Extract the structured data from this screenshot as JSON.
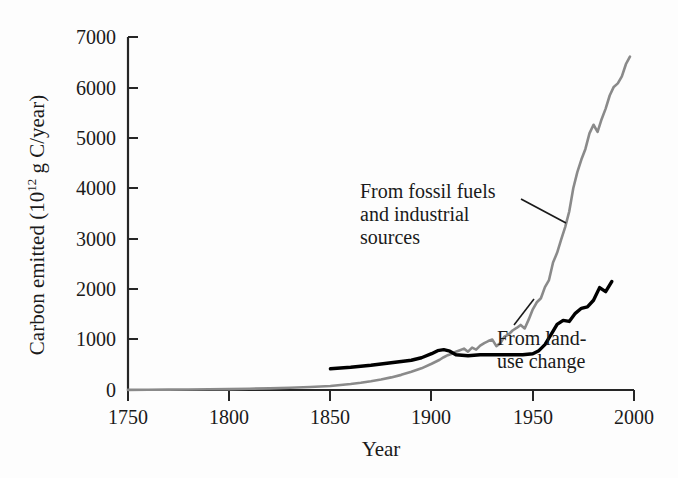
{
  "figure": {
    "background_color": "#fdfdfd",
    "axis_color": "#262626"
  },
  "chart_data": {
    "type": "line",
    "title": "",
    "xlabel": "Year",
    "ylabel": "Carbon emitted (10^12 g C/year)",
    "ylabel_prefix": "Carbon emitted (10",
    "ylabel_exponent": "12",
    "ylabel_suffix": " g C/year)",
    "xlim": [
      1750,
      2000
    ],
    "ylim": [
      0,
      7000
    ],
    "xticks": [
      1750,
      1800,
      1850,
      1900,
      1950,
      2000
    ],
    "xtick_labels": [
      "1750",
      "1800",
      "1850",
      "1900",
      "1950",
      "2000"
    ],
    "yticks": [
      0,
      1000,
      2000,
      3000,
      4000,
      5000,
      6000,
      7000
    ],
    "ytick_labels": [
      "0",
      "1000",
      "2000",
      "3000",
      "4000",
      "5000",
      "6000",
      "7000"
    ],
    "grid": false,
    "legend_position": "inline-annotations",
    "series": [
      {
        "name": "From fossil fuels and industrial sources",
        "label_lines": [
          "From fossil fuels",
          "and industrial",
          "sources"
        ],
        "color": "#8a8a8a",
        "line_width": 2.6,
        "x": [
          1750,
          1760,
          1770,
          1780,
          1790,
          1800,
          1810,
          1820,
          1830,
          1840,
          1850,
          1855,
          1860,
          1865,
          1870,
          1875,
          1880,
          1885,
          1890,
          1895,
          1900,
          1902,
          1904,
          1906,
          1908,
          1910,
          1912,
          1914,
          1916,
          1918,
          1920,
          1922,
          1924,
          1926,
          1928,
          1930,
          1932,
          1934,
          1936,
          1938,
          1940,
          1942,
          1944,
          1946,
          1948,
          1950,
          1952,
          1954,
          1956,
          1958,
          1960,
          1962,
          1964,
          1966,
          1968,
          1970,
          1972,
          1974,
          1976,
          1978,
          1980,
          1982,
          1984,
          1986,
          1988,
          1990,
          1992,
          1994,
          1996,
          1998
        ],
        "y": [
          3,
          5,
          8,
          10,
          14,
          18,
          25,
          33,
          45,
          60,
          80,
          100,
          120,
          145,
          175,
          210,
          250,
          300,
          360,
          430,
          520,
          560,
          600,
          650,
          690,
          720,
          760,
          790,
          820,
          760,
          840,
          800,
          880,
          930,
          970,
          1000,
          870,
          930,
          1060,
          1100,
          1180,
          1230,
          1290,
          1220,
          1400,
          1600,
          1740,
          1820,
          2040,
          2180,
          2530,
          2720,
          2980,
          3230,
          3540,
          4000,
          4320,
          4570,
          4780,
          5090,
          5260,
          5120,
          5370,
          5580,
          5840,
          6010,
          6080,
          6220,
          6460,
          6610
        ],
        "note": "Fossil fuel and industrial carbon emissions; jagged year-to-year variation"
      },
      {
        "name": "From land-use change",
        "label_lines": [
          "From land-",
          "use change"
        ],
        "color": "#000000",
        "line_width": 3.4,
        "x": [
          1850,
          1860,
          1870,
          1880,
          1890,
          1895,
          1900,
          1903,
          1906,
          1909,
          1912,
          1915,
          1918,
          1921,
          1924,
          1927,
          1930,
          1935,
          1940,
          1945,
          1950,
          1953,
          1956,
          1959,
          1962,
          1965,
          1968,
          1971,
          1974,
          1977,
          1980,
          1983,
          1986,
          1989
        ],
        "y": [
          420,
          450,
          490,
          540,
          590,
          640,
          720,
          780,
          800,
          770,
          700,
          690,
          680,
          690,
          700,
          700,
          700,
          700,
          700,
          700,
          720,
          780,
          900,
          1100,
          1300,
          1380,
          1360,
          1520,
          1620,
          1650,
          1780,
          2030,
          1950,
          2150
        ],
        "note": "Net carbon flux from land-use change; flat plateau 1910-1950 then rising"
      }
    ],
    "annotations": [
      {
        "name": "fossil-fuels-annotation",
        "text": "From fossil fuels\nand industrial\nsources",
        "leader_from": [
          520,
          200
        ],
        "leader_to": [
          563,
          221
        ]
      },
      {
        "name": "land-use-annotation",
        "text": "From land-\nuse change",
        "leader_from": [
          513,
          324
        ],
        "leader_to": [
          533,
          300
        ]
      }
    ]
  }
}
